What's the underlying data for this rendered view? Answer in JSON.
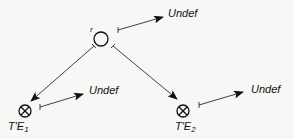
{
  "diagram": {
    "top_node": {
      "label": "r",
      "symbol": "circle"
    },
    "top_arrow_label": "Undef",
    "left_node": {
      "label_main": "T'E",
      "label_sub": "1",
      "symbol": "circle-times"
    },
    "left_arrow_label": "Undef",
    "right_node": {
      "label_main": "T'E",
      "label_sub": "2",
      "symbol": "circle-times"
    },
    "right_arrow_label": "Undef",
    "colors": {
      "stroke": "#111111",
      "background": "#f7f7f5"
    }
  }
}
